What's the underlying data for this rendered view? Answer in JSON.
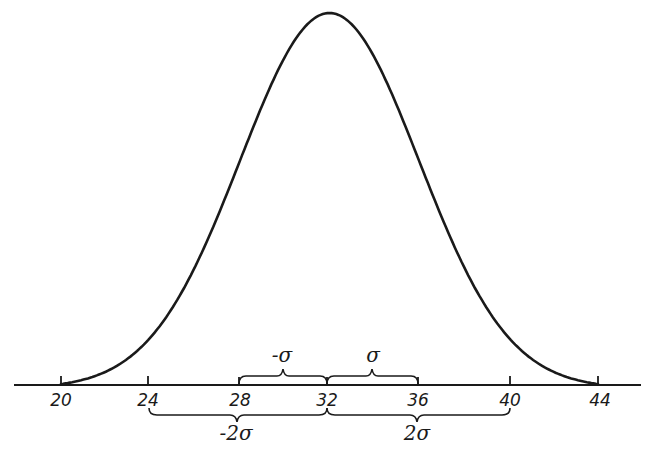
{
  "chart_data": {
    "type": "line",
    "title": "",
    "mean": 32,
    "sigma": 4,
    "xlabel": "",
    "ylabel": "",
    "x_ticks": [
      "20",
      "24",
      "28",
      "32",
      "36",
      "40",
      "44"
    ],
    "x_tick_values": [
      20,
      24,
      28,
      32,
      36,
      40,
      44
    ],
    "xlim": [
      18,
      46
    ],
    "grid": false,
    "legend": null,
    "series": [
      {
        "name": "normal curve",
        "x": [
          20,
          22,
          24,
          26,
          28,
          30,
          32,
          34,
          36,
          38,
          40,
          42,
          44
        ],
        "y": [
          0.011,
          0.044,
          0.135,
          0.325,
          0.607,
          0.882,
          1.0,
          0.882,
          0.607,
          0.325,
          0.135,
          0.044,
          0.011
        ]
      }
    ],
    "annotations": [
      {
        "label": "-σ",
        "from": 28,
        "to": 32,
        "position": "above-axis"
      },
      {
        "label": "σ",
        "from": 32,
        "to": 36,
        "position": "above-axis"
      },
      {
        "label": "-2σ",
        "from": 24,
        "to": 32,
        "position": "below-axis"
      },
      {
        "label": "2σ",
        "from": 32,
        "to": 40,
        "position": "below-axis"
      }
    ]
  },
  "axis": {
    "ticks": [
      {
        "value": 20,
        "label": "20"
      },
      {
        "value": 24,
        "label": "24"
      },
      {
        "value": 28,
        "label": "28"
      },
      {
        "value": 32,
        "label": "32"
      },
      {
        "value": 36,
        "label": "36"
      },
      {
        "value": 40,
        "label": "40"
      },
      {
        "value": 44,
        "label": "44"
      }
    ]
  },
  "braces": {
    "minus_sigma": "-σ",
    "plus_sigma": "σ",
    "minus_two_sigma": "-2σ",
    "plus_two_sigma": "2σ"
  },
  "colors": {
    "ink": "#1a1a1a",
    "background": "#ffffff"
  }
}
